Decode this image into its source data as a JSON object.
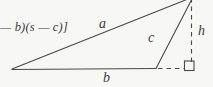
{
  "figure": {
    "background_color": "#f7f7f5",
    "ink_color": "#3c3c3c",
    "width": 213,
    "height": 87,
    "text_fragment": "— b)(s — c)]",
    "labels": {
      "side_a": "a",
      "side_b": "b",
      "side_c": "c",
      "height_h": "h"
    },
    "right_angle_marker": "right-angle-square",
    "geometry": {
      "type": "obtuse triangle with external altitude",
      "vertices": {
        "left": [
          12,
          69
        ],
        "bottom_right": [
          156,
          68
        ],
        "apex": [
          192,
          -2
        ]
      },
      "foot_of_altitude": [
        192,
        68
      ],
      "solid_edges": [
        {
          "name": "a",
          "from": [
            12,
            69
          ],
          "to": [
            192,
            -2
          ]
        },
        {
          "name": "b",
          "from": [
            12,
            69
          ],
          "to": [
            156,
            68
          ]
        },
        {
          "name": "c",
          "from": [
            156,
            68
          ],
          "to": [
            192,
            -2
          ]
        }
      ],
      "dashed_edges": [
        {
          "name": "h",
          "from": [
            192,
            -2
          ],
          "to": [
            192,
            68
          ]
        },
        {
          "name": "base-extension",
          "from": [
            156,
            68
          ],
          "to": [
            192,
            68
          ]
        }
      ]
    }
  }
}
